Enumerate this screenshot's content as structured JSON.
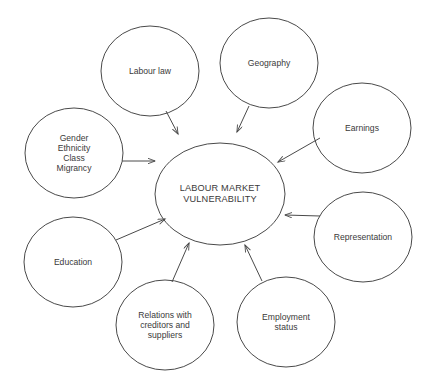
{
  "diagram": {
    "type": "hub-and-spoke concept map",
    "background_color": "#ffffff",
    "stroke_color": "#4a4a4a",
    "text_color": "#3a3a3a",
    "center": {
      "id": "labour-market-vulnerability",
      "label": "LABOUR MARKET\nVULNERABILITY",
      "cx": 220,
      "cy": 194,
      "rx": 65,
      "ry": 51
    },
    "nodes": [
      {
        "id": "labour-law",
        "label": "Labour law",
        "cx": 150,
        "cy": 71,
        "rx": 49,
        "ry": 45
      },
      {
        "id": "geography",
        "label": "Geography",
        "cx": 269,
        "cy": 63,
        "rx": 49,
        "ry": 45
      },
      {
        "id": "earnings",
        "label": "Earnings",
        "cx": 362,
        "cy": 128,
        "rx": 49,
        "ry": 45
      },
      {
        "id": "representation",
        "label": "Representation",
        "cx": 363,
        "cy": 237,
        "rx": 49,
        "ry": 45
      },
      {
        "id": "employment-status",
        "label": "Employment\nstatus",
        "cx": 286,
        "cy": 322,
        "rx": 49,
        "ry": 45
      },
      {
        "id": "relations-creditors-suppliers",
        "label": "Relations with\ncreditors and\nsuppliers",
        "cx": 165,
        "cy": 325,
        "rx": 49,
        "ry": 45
      },
      {
        "id": "education",
        "label": "Education",
        "cx": 73,
        "cy": 262,
        "rx": 49,
        "ry": 45
      },
      {
        "id": "gender-ethnicity-class-migrancy",
        "label": "Gender\nEthnicity\nClass\nMigrancy",
        "cx": 74,
        "cy": 153,
        "rx": 49,
        "ry": 45
      }
    ],
    "arrows": [
      {
        "id": "arrow-labour-law-to-center",
        "from": "labour-law",
        "to": "labour-market-vulnerability",
        "x1": 166,
        "y1": 111,
        "x2": 178,
        "y2": 134
      },
      {
        "id": "arrow-geography-to-center",
        "from": "geography",
        "to": "labour-market-vulnerability",
        "x1": 249,
        "y1": 106,
        "x2": 237,
        "y2": 132
      },
      {
        "id": "arrow-earnings-to-center",
        "from": "earnings",
        "to": "labour-market-vulnerability",
        "x1": 320,
        "y1": 138,
        "x2": 278,
        "y2": 162
      },
      {
        "id": "arrow-representation-to-center",
        "from": "representation",
        "to": "labour-market-vulnerability",
        "x1": 320,
        "y1": 216,
        "x2": 285,
        "y2": 215
      },
      {
        "id": "arrow-employment-status-to-center",
        "from": "employment-status",
        "to": "labour-market-vulnerability",
        "x1": 262,
        "y1": 281,
        "x2": 245,
        "y2": 245
      },
      {
        "id": "arrow-relations-to-center",
        "from": "relations-creditors-suppliers",
        "to": "labour-market-vulnerability",
        "x1": 172,
        "y1": 282,
        "x2": 189,
        "y2": 243
      },
      {
        "id": "arrow-education-to-center",
        "from": "education",
        "to": "labour-market-vulnerability",
        "x1": 116,
        "y1": 240,
        "x2": 165,
        "y2": 219
      },
      {
        "id": "arrow-gender-to-center",
        "from": "gender-ethnicity-class-migrancy",
        "to": "labour-market-vulnerability",
        "x1": 122,
        "y1": 161,
        "x2": 155,
        "y2": 161
      }
    ]
  }
}
